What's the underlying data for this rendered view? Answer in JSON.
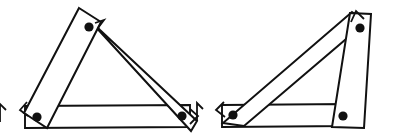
{
  "figure": {
    "background_color": "#ffffff",
    "line_color": "#111111",
    "pivot_color": "#111111",
    "bar_fill": "#ffffff",
    "stroke_width": 2,
    "pivot_radius": 4.6,
    "canvas": {
      "width": 393,
      "height": 139
    },
    "assemblies": [
      {
        "name": "left-linkage",
        "label": "",
        "joints": [
          {
            "name": "apex-joint",
            "cx": 89,
            "cy": 27,
            "r": 4.6
          },
          {
            "name": "lower-left-joint",
            "cx": 37,
            "cy": 117,
            "r": 4.6
          },
          {
            "name": "lower-right-joint",
            "cx": 182,
            "cy": 116,
            "r": 4.6
          }
        ],
        "bars": [
          {
            "name": "left-upright-bar",
            "points": "79,8 101,22 47,128 24,113"
          },
          {
            "name": "upper-diagonal-bar",
            "points": "83,13 100,30 197,121 191,131"
          },
          {
            "name": "bottom-horizontal-bar",
            "points": "25,106 190,105 190,127 25,128"
          }
        ],
        "notches": [
          {
            "name": "apex-arrow-notch",
            "points": "95,23 104,20 98,28"
          },
          {
            "name": "lower-left-edge-notch",
            "points": "27,102 20,110 28,116"
          },
          {
            "name": "lower-right-edge-notch",
            "points": "190,109 198,116 190,124"
          }
        ]
      },
      {
        "name": "right-linkage",
        "label": "",
        "joints": [
          {
            "name": "upper-right-joint",
            "cx": 360,
            "cy": 28,
            "r": 4.6
          },
          {
            "name": "lower-left-joint",
            "cx": 233,
            "cy": 115,
            "r": 4.6
          },
          {
            "name": "lower-right-joint",
            "cx": 343,
            "cy": 116,
            "r": 4.6
          }
        ],
        "bars": [
          {
            "name": "right-upright-bar",
            "points": "350,13 371,14 364,128 332,127"
          },
          {
            "name": "long-diagonal-bar",
            "points": "352,12 366,22 244,126 223,123"
          },
          {
            "name": "bottom-horizontal-bar",
            "points": "222,105 348,104 348,126 222,127"
          }
        ],
        "notches": [
          {
            "name": "top-arrow-notch",
            "points": "351,22 356,11 364,19"
          },
          {
            "name": "lower-left-edge-notch",
            "points": "224,102 216,110 225,117"
          }
        ]
      }
    ],
    "edge_fragments": [
      {
        "name": "left-edge-arrow-fragment",
        "points": "6,110 0,104 0,122"
      },
      {
        "name": "mid-edge-arrow-fragment",
        "points": "203,109 197,103 197,121"
      }
    ]
  }
}
